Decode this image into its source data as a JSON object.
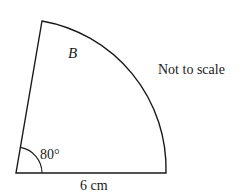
{
  "diagram": {
    "type": "sector",
    "region_label": "B",
    "angle_label": "80°",
    "radius_label": "6 cm",
    "note": "Not to scale",
    "angle_degrees": 80,
    "radius_cm": 6,
    "stroke_color": "#1a1a1a",
    "background": "#ffffff"
  }
}
